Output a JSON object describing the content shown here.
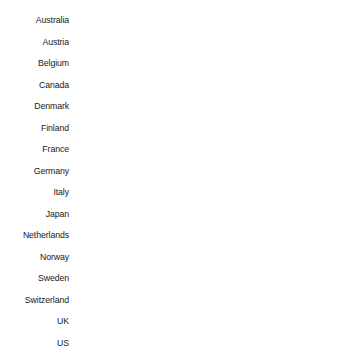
{
  "chart_data": {
    "type": "bar",
    "orientation": "horizontal",
    "title": "",
    "subtitle": "",
    "xlabel": "",
    "ylabel": "",
    "grid": false,
    "legend": null,
    "axis_visible": false,
    "tick_labels_x": [],
    "bar_color": "#000000",
    "background_color": "#ffffff",
    "label_color": "#1a1a1a",
    "xlim": [
      0,
      267
    ],
    "categories": [
      "Australia",
      "Austria",
      "Belgium",
      "Canada",
      "Denmark",
      "Finland",
      "France",
      "Germany",
      "Italy",
      "Japan",
      "Netherlands",
      "Norway",
      "Sweden",
      "Switzerland",
      "UK",
      "US"
    ],
    "values": [
      151,
      118,
      81,
      187,
      96,
      93,
      85,
      66,
      61,
      96,
      68,
      132,
      61,
      57,
      233,
      267
    ]
  }
}
